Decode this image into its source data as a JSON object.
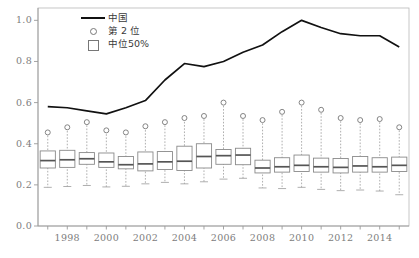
{
  "legend": {
    "position": "top-center-left",
    "items": [
      {
        "label": "中国",
        "key": "line-key-icon"
      },
      {
        "label": "第 2 位",
        "key": "circle-key-icon"
      },
      {
        "label": "中位50%",
        "key": "box-key-icon"
      }
    ]
  },
  "axes": {
    "y_ticks": [
      "0.0",
      "0.2",
      "0.4",
      "0.6",
      "0.8",
      "1.0"
    ],
    "x_ticks": [
      "1998",
      "2000",
      "2002",
      "2004",
      "2006",
      "2008",
      "2010",
      "2012",
      "2014"
    ]
  },
  "colors": {
    "line": "#111111",
    "box_stroke": "#8a8a8a",
    "median": "#555555",
    "whisker": "#9a9a9a",
    "circle": "#777777",
    "axis": "#9a9a9a",
    "tick_text": "#7d7d7d",
    "frame": "#b8b8b8"
  },
  "chart_data": {
    "type": "line",
    "title": "",
    "xlabel": "",
    "ylabel": "",
    "xlim": [
      1996.5,
      2015.5
    ],
    "ylim": [
      0.0,
      1.06
    ],
    "grid": false,
    "legend_position": "top-left-center",
    "x": [
      1997,
      1998,
      1999,
      2000,
      2001,
      2002,
      2003,
      2004,
      2005,
      2006,
      2007,
      2008,
      2009,
      2010,
      2011,
      2012,
      2013,
      2014,
      2015
    ],
    "series": [
      {
        "name": "中国",
        "type": "line",
        "values": [
          0.58,
          0.575,
          0.56,
          0.545,
          0.575,
          0.61,
          0.71,
          0.79,
          0.775,
          0.8,
          0.845,
          0.88,
          0.945,
          1.0,
          0.965,
          0.935,
          0.925,
          0.925,
          0.87
        ]
      },
      {
        "name": "第 2 位",
        "type": "scatter",
        "values": [
          0.455,
          0.48,
          0.505,
          0.465,
          0.455,
          0.485,
          0.505,
          0.525,
          0.535,
          0.6,
          0.535,
          0.515,
          0.555,
          0.6,
          0.565,
          0.525,
          0.515,
          0.52,
          0.48
        ]
      },
      {
        "name": "中位50%",
        "type": "box",
        "boxes": [
          {
            "x": 1997,
            "whisker_low": 0.188,
            "q1": 0.282,
            "median": 0.318,
            "q3": 0.365,
            "whisker_high": 0.455
          },
          {
            "x": 1998,
            "whisker_low": 0.192,
            "q1": 0.285,
            "median": 0.322,
            "q3": 0.368,
            "whisker_high": 0.478
          },
          {
            "x": 1999,
            "whisker_low": 0.197,
            "q1": 0.3,
            "median": 0.327,
            "q3": 0.357,
            "whisker_high": 0.505
          },
          {
            "x": 2000,
            "whisker_low": 0.19,
            "q1": 0.285,
            "median": 0.312,
            "q3": 0.355,
            "whisker_high": 0.462
          },
          {
            "x": 2001,
            "whisker_low": 0.193,
            "q1": 0.278,
            "median": 0.298,
            "q3": 0.338,
            "whisker_high": 0.452
          },
          {
            "x": 2002,
            "whisker_low": 0.205,
            "q1": 0.268,
            "median": 0.302,
            "q3": 0.36,
            "whisker_high": 0.482
          },
          {
            "x": 2003,
            "whisker_low": 0.212,
            "q1": 0.275,
            "median": 0.312,
            "q3": 0.362,
            "whisker_high": 0.505
          },
          {
            "x": 2004,
            "whisker_low": 0.205,
            "q1": 0.27,
            "median": 0.315,
            "q3": 0.388,
            "whisker_high": 0.522
          },
          {
            "x": 2005,
            "whisker_low": 0.215,
            "q1": 0.282,
            "median": 0.338,
            "q3": 0.4,
            "whisker_high": 0.535
          },
          {
            "x": 2006,
            "whisker_low": 0.228,
            "q1": 0.3,
            "median": 0.342,
            "q3": 0.372,
            "whisker_high": 0.6
          },
          {
            "x": 2007,
            "whisker_low": 0.232,
            "q1": 0.298,
            "median": 0.345,
            "q3": 0.378,
            "whisker_high": 0.535
          },
          {
            "x": 2008,
            "whisker_low": 0.185,
            "q1": 0.258,
            "median": 0.282,
            "q3": 0.32,
            "whisker_high": 0.515
          },
          {
            "x": 2009,
            "whisker_low": 0.182,
            "q1": 0.262,
            "median": 0.288,
            "q3": 0.332,
            "whisker_high": 0.555
          },
          {
            "x": 2010,
            "whisker_low": 0.188,
            "q1": 0.265,
            "median": 0.295,
            "q3": 0.345,
            "whisker_high": 0.6
          },
          {
            "x": 2011,
            "whisker_low": 0.178,
            "q1": 0.262,
            "median": 0.288,
            "q3": 0.33,
            "whisker_high": 0.565
          },
          {
            "x": 2012,
            "whisker_low": 0.172,
            "q1": 0.258,
            "median": 0.285,
            "q3": 0.328,
            "whisker_high": 0.525
          },
          {
            "x": 2013,
            "whisker_low": 0.175,
            "q1": 0.262,
            "median": 0.292,
            "q3": 0.338,
            "whisker_high": 0.515
          },
          {
            "x": 2014,
            "whisker_low": 0.17,
            "q1": 0.262,
            "median": 0.288,
            "q3": 0.332,
            "whisker_high": 0.52
          },
          {
            "x": 2015,
            "whisker_low": 0.152,
            "q1": 0.265,
            "median": 0.295,
            "q3": 0.335,
            "whisker_high": 0.48
          }
        ]
      }
    ]
  }
}
